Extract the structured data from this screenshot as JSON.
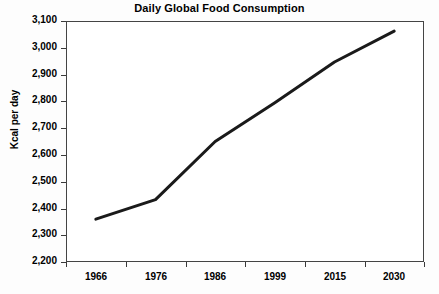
{
  "chart_data": {
    "type": "line",
    "title": "Daily Global Food Consumption",
    "xlabel": "",
    "ylabel": "Kcal per day",
    "categories": [
      "1966",
      "1976",
      "1986",
      "1999",
      "2015",
      "2030"
    ],
    "values": [
      2360,
      2433,
      2650,
      2795,
      2947,
      3062
    ],
    "series": [
      {
        "name": "Daily global food consumption",
        "values": [
          2360,
          2433,
          2650,
          2795,
          2947,
          3062
        ]
      }
    ],
    "ylim": [
      2200,
      3100
    ],
    "ytick_step": 100,
    "ytick_labels": [
      "3,100",
      "3,000",
      "2,900",
      "2,800",
      "2,700",
      "2,600",
      "2,500",
      "2,400",
      "2,300",
      "2,200"
    ],
    "ytick_values": [
      3100,
      3000,
      2900,
      2800,
      2700,
      2600,
      2500,
      2400,
      2300,
      2200
    ],
    "grid": false,
    "legend": false,
    "legend_position": "none",
    "line_color": "#1a1a1a",
    "line_width": 3,
    "plot_background": "#ffffff",
    "axis_color": "#444444",
    "text_color": "#000000"
  }
}
